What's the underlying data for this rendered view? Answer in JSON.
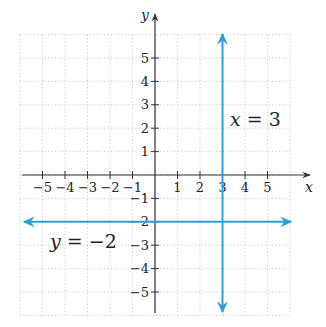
{
  "chart_data": {
    "type": "line",
    "title": "",
    "xlabel": "x",
    "ylabel": "y",
    "xlim": [
      -6,
      6
    ],
    "ylim": [
      -6,
      6
    ],
    "grid": true,
    "grid_style": "dotted",
    "x_ticks": [
      -5,
      -4,
      -3,
      -2,
      -1,
      1,
      2,
      3,
      4,
      5
    ],
    "y_ticks": [
      -5,
      -4,
      -3,
      -2,
      -1,
      1,
      2,
      3,
      4,
      5
    ],
    "x_tick_labels": [
      "−5",
      "−4",
      "−3",
      "−2",
      "−1",
      "1",
      "2",
      "3",
      "4",
      "5"
    ],
    "y_tick_labels": [
      "−5",
      "−4",
      "−3",
      "−2",
      "−1",
      "1",
      "2",
      "3",
      "4",
      "5"
    ],
    "series": [
      {
        "name": "x = 3",
        "kind": "vertical_line",
        "x": [
          3,
          3
        ],
        "y": [
          -6,
          6
        ],
        "color": "#2a9fd8",
        "arrows": "both",
        "label": {
          "var": "x",
          "eq": " = 3"
        }
      },
      {
        "name": "y = −2",
        "kind": "horizontal_line",
        "x": [
          -6,
          6
        ],
        "y": [
          -2,
          -2
        ],
        "color": "#2a9fd8",
        "arrows": "both",
        "label": {
          "var": "y",
          "eq": " = −2"
        }
      }
    ]
  },
  "axes": {
    "x_label": "x",
    "y_label": "y",
    "color": "#333333"
  },
  "colors": {
    "line": "#2a9fd8",
    "grid": "#b8b8b8",
    "axis": "#333333"
  }
}
